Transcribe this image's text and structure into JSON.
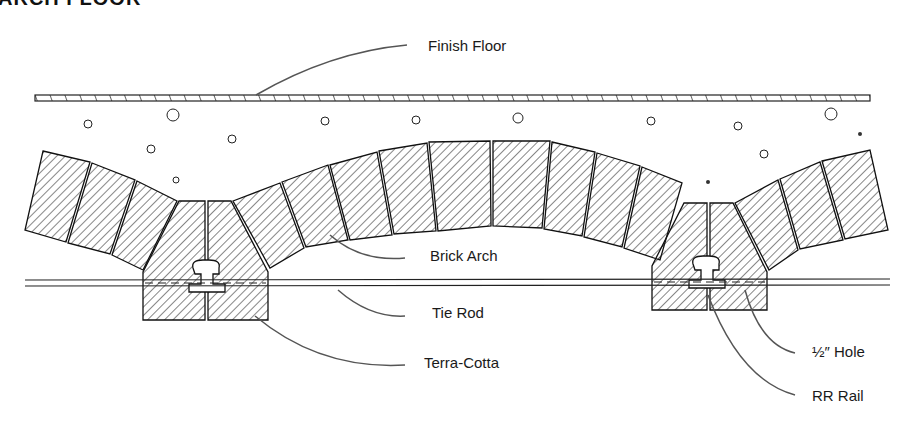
{
  "title": "ARCH FLOOR",
  "labels": {
    "finish_floor": "Finish Floor",
    "brick_arch": "Brick Arch",
    "tie_rod": "Tie Rod",
    "terra_cotta": "Terra-Cotta",
    "half_inch_hole": "½″ Hole",
    "rr_rail": "RR Rail"
  },
  "colors": {
    "ink": "#1a1a1a",
    "leader": "#555555",
    "background": "#ffffff"
  }
}
